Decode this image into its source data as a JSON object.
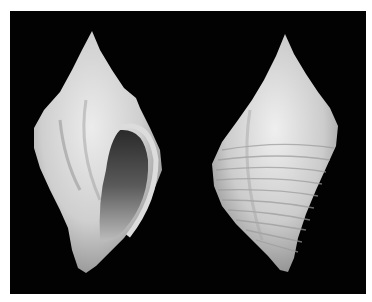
{
  "image": {
    "subject": "Two views of a gastropod shell on black background",
    "views": [
      {
        "label": "apertural view"
      },
      {
        "label": "dorsal view"
      }
    ],
    "colors": {
      "background": "#020202",
      "border": "#ffffff",
      "shell_light": "#e4e4e4",
      "shell_mid": "#b5b5b5",
      "aperture_dark": "#3a3a3a"
    }
  }
}
